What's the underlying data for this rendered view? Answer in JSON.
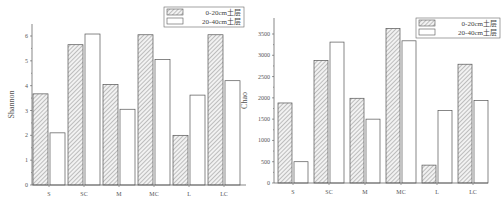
{
  "chart_data": [
    {
      "type": "bar",
      "title": "",
      "xlabel": "",
      "ylabel": "Shannon",
      "ylim": [
        0,
        6.5
      ],
      "yticks": [
        0,
        1,
        2,
        3,
        4,
        5,
        6
      ],
      "categories": [
        "S",
        "SC",
        "M",
        "MC",
        "L",
        "LC"
      ],
      "series": [
        {
          "name": "0-20cm土层",
          "pattern": "hatched",
          "values": [
            3.67,
            5.65,
            4.05,
            6.05,
            2.0,
            6.05
          ]
        },
        {
          "name": "20-40cm土层",
          "pattern": "white",
          "values": [
            2.1,
            6.08,
            3.05,
            5.05,
            3.62,
            4.2
          ]
        }
      ],
      "legend_position": "upper right",
      "grid": false
    },
    {
      "type": "bar",
      "title": "",
      "xlabel": "",
      "ylabel": "Chao",
      "ylim": [
        0,
        3900
      ],
      "yticks": [
        0,
        500,
        1000,
        1500,
        2000,
        2500,
        3000,
        3500
      ],
      "categories": [
        "S",
        "SC",
        "M",
        "MC",
        "L",
        "LC"
      ],
      "series": [
        {
          "name": "0-20cm土层",
          "pattern": "hatched",
          "values": [
            1880,
            2880,
            1990,
            3630,
            420,
            2790
          ]
        },
        {
          "name": "20-40cm土层",
          "pattern": "white",
          "values": [
            500,
            3310,
            1500,
            3340,
            1700,
            1940
          ]
        }
      ],
      "legend_position": "upper right",
      "grid": false
    }
  ],
  "colors": {
    "axis": "#555555",
    "bar_stroke": "#555555",
    "hatch": "#888888",
    "fill_white": "#ffffff"
  }
}
